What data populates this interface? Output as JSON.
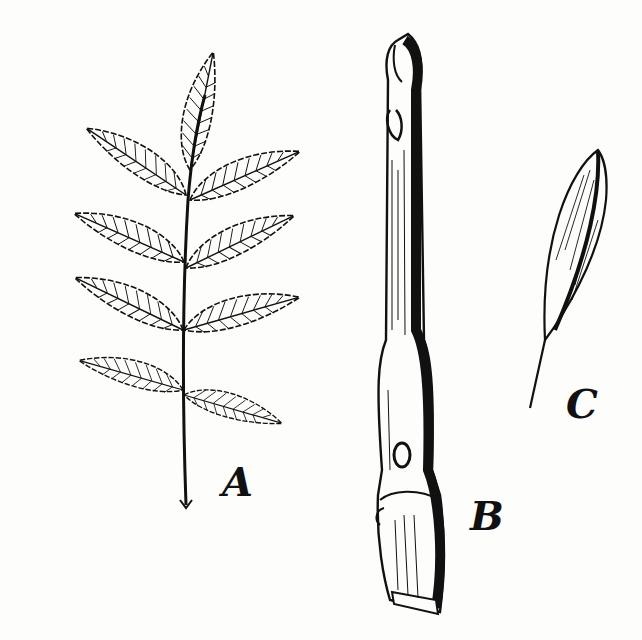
{
  "figure": {
    "ink_color": "#111111",
    "paper_color": "#fdfdfb",
    "labels": {
      "leaf": "A",
      "twig": "B",
      "samara": "C"
    },
    "parts": [
      {
        "id": "A",
        "depicts": "compound leaf with serrated leaflets"
      },
      {
        "id": "B",
        "depicts": "twig with terminal bud and leaf scars"
      },
      {
        "id": "C",
        "depicts": "winged seed (samara)"
      }
    ]
  }
}
